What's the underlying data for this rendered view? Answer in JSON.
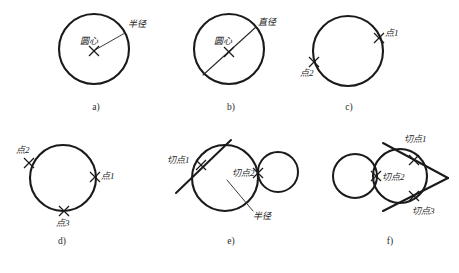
{
  "figure": {
    "stroke_color": "#1a1a1a",
    "background_color": "#ffffff"
  },
  "panels": [
    {
      "id": "a",
      "caption": "a)",
      "caption_x": 96,
      "caption_y": 110,
      "circles": [
        {
          "name": "main-circle",
          "cx": 94,
          "cy": 49,
          "r": 35
        }
      ],
      "center_marks": [
        {
          "name": "center-mark",
          "x": 94,
          "y": 51,
          "size": 5
        }
      ],
      "lines": [
        {
          "name": "radius-line",
          "x1": 95,
          "y1": 50,
          "x2": 125,
          "y2": 33,
          "kind": "lead"
        }
      ],
      "labels": [
        {
          "name": "center-label",
          "text": "圆心",
          "x": 80,
          "y": 44,
          "anchor": "start"
        },
        {
          "name": "radius-label",
          "text": "半径",
          "x": 128,
          "y": 27,
          "anchor": "start"
        }
      ]
    },
    {
      "id": "b",
      "caption": "b)",
      "caption_x": 231,
      "caption_y": 110,
      "circles": [
        {
          "name": "main-circle",
          "cx": 229,
          "cy": 49,
          "r": 35
        }
      ],
      "center_marks": [
        {
          "name": "center-mark",
          "x": 229,
          "y": 52,
          "size": 5
        }
      ],
      "lines": [
        {
          "name": "diameter-line",
          "x1": 203,
          "y1": 75,
          "x2": 256,
          "y2": 27,
          "kind": "diameter"
        }
      ],
      "labels": [
        {
          "name": "center-label",
          "text": "圆心",
          "x": 214,
          "y": 44,
          "anchor": "start"
        },
        {
          "name": "diameter-label",
          "text": "直径",
          "x": 258,
          "y": 25,
          "anchor": "start"
        }
      ]
    },
    {
      "id": "c",
      "caption": "c)",
      "caption_x": 349,
      "caption_y": 110,
      "circles": [
        {
          "name": "main-circle",
          "cx": 348,
          "cy": 51,
          "r": 35
        }
      ],
      "center_marks": [],
      "lines": [],
      "point_marks": [
        {
          "name": "point-1-mark",
          "x": 379,
          "y": 38,
          "size": 5
        },
        {
          "name": "point-2-mark",
          "x": 314,
          "y": 62,
          "size": 5
        }
      ],
      "labels": [
        {
          "name": "point-1-label",
          "text": "点1",
          "x": 385,
          "y": 36,
          "anchor": "start"
        },
        {
          "name": "point-2-label",
          "text": "点2",
          "x": 300,
          "y": 76,
          "anchor": "start"
        }
      ]
    },
    {
      "id": "d",
      "caption": "d)",
      "caption_x": 62,
      "caption_y": 244,
      "circles": [
        {
          "name": "main-circle",
          "cx": 63,
          "cy": 178,
          "r": 33
        }
      ],
      "center_marks": [],
      "lines": [],
      "point_marks": [
        {
          "name": "point-1-mark",
          "x": 95,
          "y": 177,
          "size": 5
        },
        {
          "name": "point-2-mark",
          "x": 29,
          "y": 163,
          "size": 5
        },
        {
          "name": "point-3-mark",
          "x": 64,
          "y": 211,
          "size": 5
        }
      ],
      "labels": [
        {
          "name": "point-1-label",
          "text": "点1",
          "x": 101,
          "y": 179,
          "anchor": "start"
        },
        {
          "name": "point-2-label",
          "text": "点2",
          "x": 16,
          "y": 153,
          "anchor": "start"
        },
        {
          "name": "point-3-label",
          "text": "点3",
          "x": 56,
          "y": 226,
          "anchor": "start"
        }
      ]
    },
    {
      "id": "e",
      "caption": "e)",
      "caption_x": 231,
      "caption_y": 244,
      "circles": [
        {
          "name": "main-circle",
          "cx": 225,
          "cy": 178,
          "r": 33
        },
        {
          "name": "small-circle",
          "cx": 278,
          "cy": 172,
          "r": 20
        }
      ],
      "center_marks": [],
      "lines": [
        {
          "name": "tangent-line",
          "x1": 176,
          "y1": 193,
          "x2": 231,
          "y2": 140,
          "kind": "tangent"
        },
        {
          "name": "radius-lead-line",
          "x1": 227,
          "y1": 180,
          "x2": 253,
          "y2": 211,
          "kind": "lead"
        }
      ],
      "point_marks": [
        {
          "name": "tangent-point-1-mark",
          "x": 201,
          "y": 165,
          "size": 5
        },
        {
          "name": "tangent-point-2-mark",
          "x": 258,
          "y": 173,
          "size": 5
        }
      ],
      "labels": [
        {
          "name": "tangent-point-1-label",
          "text": "切点1",
          "x": 167,
          "y": 163,
          "anchor": "start"
        },
        {
          "name": "tangent-point-2-label",
          "text": "切点2",
          "x": 232,
          "y": 176,
          "anchor": "start"
        },
        {
          "name": "radius-label",
          "text": "半径",
          "x": 253,
          "y": 219,
          "anchor": "start"
        }
      ]
    },
    {
      "id": "f",
      "caption": "f)",
      "caption_x": 390,
      "caption_y": 244,
      "circles": [
        {
          "name": "small-circle",
          "cx": 355,
          "cy": 176,
          "r": 22
        },
        {
          "name": "main-circle",
          "cx": 400,
          "cy": 176,
          "r": 27
        }
      ],
      "center_marks": [],
      "lines": [
        {
          "name": "tangent-line-upper",
          "x1": 383,
          "y1": 143,
          "x2": 448,
          "y2": 178,
          "kind": "tangent"
        },
        {
          "name": "tangent-line-lower",
          "x1": 383,
          "y1": 211,
          "x2": 448,
          "y2": 178,
          "kind": "tangent"
        }
      ],
      "point_marks": [
        {
          "name": "tangent-point-1-mark",
          "x": 414,
          "y": 160,
          "size": 5
        },
        {
          "name": "tangent-point-2-mark",
          "x": 376,
          "y": 176,
          "size": 5
        },
        {
          "name": "tangent-point-3-mark",
          "x": 414,
          "y": 196,
          "size": 5
        }
      ],
      "labels": [
        {
          "name": "tangent-point-1-label",
          "text": "切点1",
          "x": 404,
          "y": 142,
          "anchor": "start"
        },
        {
          "name": "tangent-point-2-label",
          "text": "切点2",
          "x": 382,
          "y": 180,
          "anchor": "start"
        },
        {
          "name": "tangent-point-3-label",
          "text": "切点3",
          "x": 412,
          "y": 214,
          "anchor": "start"
        }
      ]
    }
  ]
}
